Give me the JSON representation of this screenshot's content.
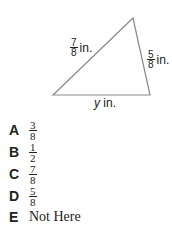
{
  "figure": {
    "side_left": {
      "num": "7",
      "den": "8",
      "unit": "in."
    },
    "side_right": {
      "num": "5",
      "den": "8",
      "unit": "in."
    },
    "side_bottom": {
      "var": "y",
      "unit": "in."
    },
    "stroke_color": "#888888"
  },
  "options": [
    {
      "letter": "A",
      "num": "3",
      "den": "8"
    },
    {
      "letter": "B",
      "num": "1",
      "den": "2"
    },
    {
      "letter": "C",
      "num": "7",
      "den": "8"
    },
    {
      "letter": "D",
      "num": "5",
      "den": "8"
    },
    {
      "letter": "E",
      "text": "Not Here"
    }
  ]
}
